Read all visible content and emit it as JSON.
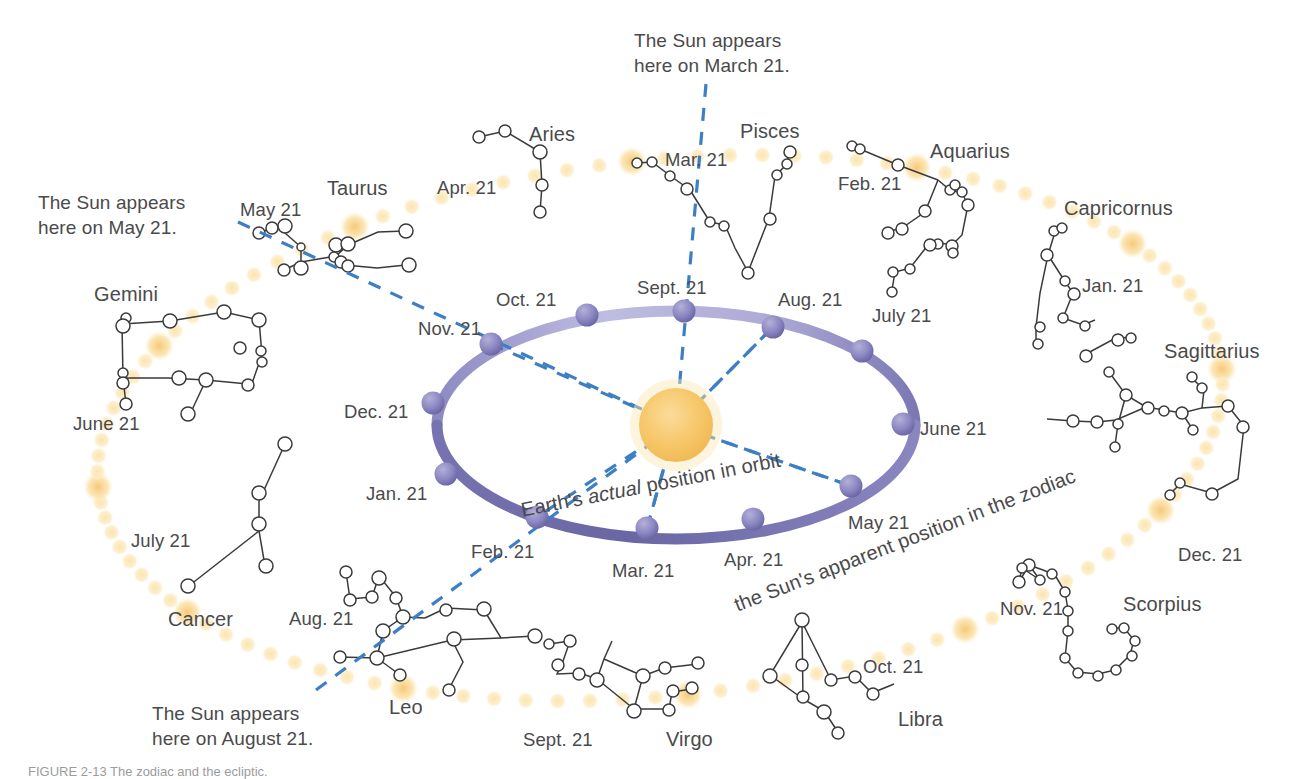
{
  "colors": {
    "sun": "#F7C76A",
    "sun_glow": "#FBE0A6",
    "ecliptic_dot": "#FAE3A8",
    "ecliptic_dot_bright": "#F8CF7D",
    "orbit_dark": "#6F6BA8",
    "orbit_light": "#B9B6DB",
    "earth_sphere": "#8884BC",
    "dashed_blue": "#3C7FC4",
    "star_outline": "#3a3a3c",
    "text": "#4a4a4c"
  },
  "callouts": [
    {
      "name": "callout-may",
      "line1": "The Sun appears",
      "line2": "here on May 21.",
      "x": 38,
      "y": 190
    },
    {
      "name": "callout-march",
      "line1": "The Sun appears",
      "line2": "here on March 21.",
      "x": 634,
      "y": 28
    },
    {
      "name": "callout-august",
      "line1": "The Sun appears",
      "line2": "here on August 21.",
      "x": 152,
      "y": 701
    }
  ],
  "orbit_labels": {
    "earth_position": {
      "pre": "Earth's ",
      "italic": "actual",
      "post": " position in orbit"
    },
    "sun_apparent": "the Sun's apparent position in the zodiac"
  },
  "constellations": [
    {
      "name": "Aries",
      "x": 529,
      "y": 123
    },
    {
      "name": "Taurus",
      "x": 327,
      "y": 177
    },
    {
      "name": "Gemini",
      "x": 94,
      "y": 283
    },
    {
      "name": "Cancer",
      "x": 168,
      "y": 608
    },
    {
      "name": "Leo",
      "x": 389,
      "y": 696
    },
    {
      "name": "Virgo",
      "x": 666,
      "y": 728
    },
    {
      "name": "Libra",
      "x": 898,
      "y": 708
    },
    {
      "name": "Scorpius",
      "x": 1123,
      "y": 593
    },
    {
      "name": "Sagittarius",
      "x": 1164,
      "y": 340
    },
    {
      "name": "Capricornus",
      "x": 1064,
      "y": 197
    },
    {
      "name": "Aquarius",
      "x": 930,
      "y": 140
    },
    {
      "name": "Pisces",
      "x": 740,
      "y": 120
    }
  ],
  "zodiac_dates": [
    {
      "label": "Apr. 21",
      "x": 437,
      "y": 176
    },
    {
      "label": "May 21",
      "x": 240,
      "y": 198
    },
    {
      "label": "June 21",
      "x": 73,
      "y": 412
    },
    {
      "label": "July 21",
      "x": 131,
      "y": 529
    },
    {
      "label": "Aug. 21",
      "x": 289,
      "y": 607
    },
    {
      "label": "Sept. 21",
      "x": 523,
      "y": 728
    },
    {
      "label": "Oct. 21",
      "x": 863,
      "y": 655
    },
    {
      "label": "Nov. 21",
      "x": 1000,
      "y": 597
    },
    {
      "label": "Dec. 21",
      "x": 1178,
      "y": 543
    },
    {
      "label": "Jan. 21",
      "x": 1082,
      "y": 274
    },
    {
      "label": "Feb. 21",
      "x": 838,
      "y": 172
    },
    {
      "label": "Mar. 21",
      "x": 665,
      "y": 148
    }
  ],
  "orbit_dates": [
    {
      "label": "Sept. 21",
      "x": 637,
      "y": 276,
      "px": 684,
      "py": 311
    },
    {
      "label": "Aug. 21",
      "x": 778,
      "y": 288,
      "px": 773,
      "py": 327
    },
    {
      "label": "July 21",
      "x": 872,
      "y": 304,
      "px": 862,
      "py": 351
    },
    {
      "label": "June 21",
      "x": 920,
      "y": 417,
      "px": 903,
      "py": 424
    },
    {
      "label": "May 21",
      "x": 848,
      "y": 511,
      "px": 851,
      "py": 486
    },
    {
      "label": "Apr. 21",
      "x": 724,
      "y": 548,
      "px": 753,
      "py": 519
    },
    {
      "label": "Mar. 21",
      "x": 612,
      "y": 559,
      "px": 647,
      "py": 528
    },
    {
      "label": "Feb. 21",
      "x": 471,
      "y": 540,
      "px": 537,
      "py": 517
    },
    {
      "label": "Jan. 21",
      "x": 366,
      "y": 482,
      "px": 446,
      "py": 474
    },
    {
      "label": "Dec. 21",
      "x": 344,
      "y": 400,
      "px": 433,
      "py": 403
    },
    {
      "label": "Nov. 21",
      "x": 418,
      "y": 317,
      "px": 491,
      "py": 344
    },
    {
      "label": "Oct. 21",
      "x": 496,
      "y": 288,
      "px": 587,
      "py": 315
    }
  ],
  "sun": {
    "cx": 676,
    "cy": 425,
    "r": 37
  },
  "orbit": {
    "cx": 676,
    "cy": 425,
    "rx": 239,
    "ry": 114
  },
  "caption": "FIGURE 2-13  The zodiac and the ecliptic."
}
